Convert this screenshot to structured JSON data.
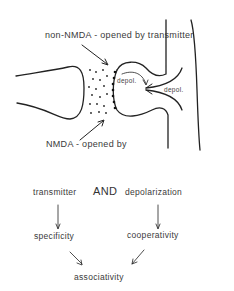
{
  "diagram": {
    "labels": {
      "non_nmda": "non-NMDA  -  opened by transmitter",
      "nmda": "NMDA  -  opened by",
      "depol_inner": "depol.",
      "depol_outer": "depol."
    },
    "flow": {
      "left_top": "transmitter",
      "connector": "AND",
      "right_top": "depolarization",
      "left_mid": "specificity",
      "right_mid": "cooperativity",
      "bottom": "associativity"
    }
  }
}
